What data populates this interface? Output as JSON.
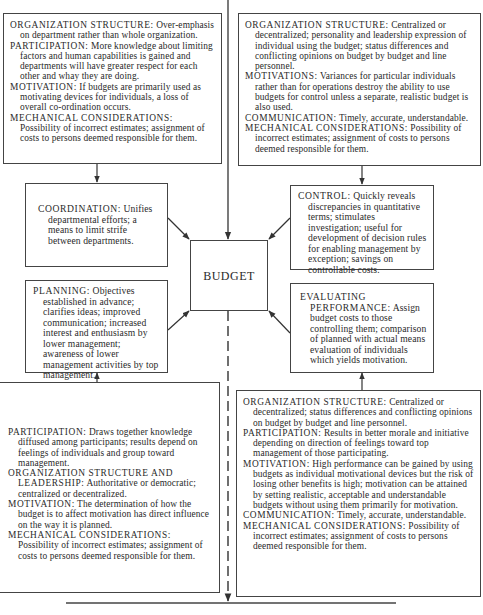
{
  "center": {
    "label": "BUDGET"
  },
  "top_left": {
    "entries": [
      {
        "label": "ORGANIZATION STRUCTURE:",
        "text": " Over-emphasis on department rather than whole organization."
      },
      {
        "label": "PARTICIPATION:",
        "text": " More knowledge about limiting factors and human capabilities is gained and departments will have greater respect for each other and whay they are doing."
      },
      {
        "label": "MOTIVATION:",
        "text": " If budgets are primarily used as motivating devices for individuals, a loss of overall co-ordination occurs."
      },
      {
        "label": "MECHANICAL CONSIDERATIONS:",
        "text": " Possibility of incorrect estimates; assignment of costs to persons deemed responsible for them."
      }
    ]
  },
  "top_right": {
    "entries": [
      {
        "label": "ORGANIZATION STRUCTURE:",
        "text": " Centralized or decentralized; personality and leadership expression of individual using the budget; status differences and conflicting opinions on budget by budget and line personnel."
      },
      {
        "label": "MOTIVATIONS:",
        "text": " Variances for particular individuals rather than for operations destroy the ability to use budgets for control unless a separate, realistic budget is also used."
      },
      {
        "label": "COMMUNICATION:",
        "text": " Timely, accurate, understandable."
      },
      {
        "label": "MECHANICAL CONSIDERATIONS:",
        "text": " Possibility of incorrect estimates; assignment of costs to persons deemed responsible for them."
      }
    ]
  },
  "coordination": {
    "label": "COORDINATION:",
    "text": " Unifies departmental efforts; a means to limit strife between departments."
  },
  "planning": {
    "label": "PLANNING:",
    "text": " Objectives established in advance; clarifies ideas; improved communication; increased interest and enthusiasm by lower management; awareness of lower management activities by top management."
  },
  "control": {
    "label": "CONTROL:",
    "text": " Quickly reveals discrepancies in quantitative terms; stimulates investigation; useful for development of decision rules for enabling management by exception; savings on controllable costs."
  },
  "evaluating": {
    "label": "EVALUATING PERFORMANCE:",
    "text": " Assign budget costs to those controlling them; comparison of planned with actual means evaluation of individuals which yields motivation."
  },
  "bottom_left": {
    "entries": [
      {
        "label": "PARTICIPATION:",
        "text": " Draws together knowledge diffused among participants; results depend on feelings of individuals and group toward management."
      },
      {
        "label": "ORGANIZATION STRUCTURE AND LEADERSHIP:",
        "text": " Authoritative or democratic; centralized or decentralized."
      },
      {
        "label": "MOTIVATION:",
        "text": " The determination of how the budget is to affect motivation has direct influence on the way it is planned."
      },
      {
        "label": "MECHANICAL CONSIDERATIONS:",
        "text": " Possibility of incorrect estimates; assignment of costs to persons deemed responsible for them."
      }
    ]
  },
  "bottom_right": {
    "entries": [
      {
        "label": "ORGANIZATION STRUCTURE:",
        "text": " Centralized or decentralized; status differences and conflicting opinions on budget by budget and line personnel."
      },
      {
        "label": "PARTICIPATION:",
        "text": " Results in better morale and initiative depending on direction of feelings toward top management of those participating."
      },
      {
        "label": "MOTIVATION:",
        "text": " High performance can be gained by using budgets as individual motivational devices but the risk of losing other benefits is high; motivation can be attained by setting realistic, acceptable and understandable budgets without using them primarily for motivation."
      },
      {
        "label": "COMMUNICATION:",
        "text": " Timely, accurate, understandable."
      },
      {
        "label": "MECHANICAL CONSIDERATIONS:",
        "text": " Possibility of incorrect estimates; assignment of costs to persons deemed responsible for them."
      }
    ]
  }
}
